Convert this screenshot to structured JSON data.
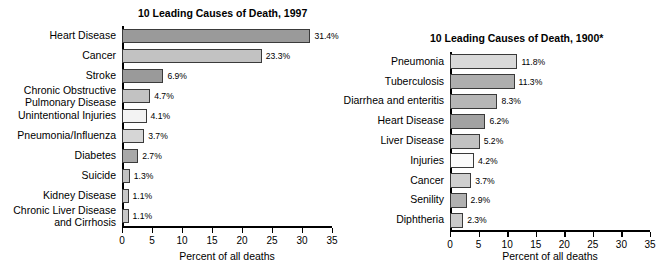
{
  "chart_data": [
    {
      "id": "left",
      "type": "bar",
      "orientation": "horizontal",
      "title": "10 Leading Causes of Death, 1997",
      "xlabel": "Percent of all deaths",
      "ylabel": "",
      "xlim": [
        0,
        35
      ],
      "xticks": [
        0,
        5,
        10,
        15,
        20,
        25,
        30,
        35
      ],
      "xticklabels": [
        "0",
        "5",
        "10",
        "15",
        "20",
        "25",
        "30",
        "35"
      ],
      "grid": false,
      "legend": false,
      "categories": [
        "Heart Disease",
        "Cancer",
        "Chronic Obstructive\nPulmonary Disease",
        "Stroke",
        "Unintentional Injuries",
        "Pneumonia/Influenza",
        "Diabetes",
        "Suicide",
        "Kidney Disease",
        "Chronic Liver Disease\nand Cirrhosis"
      ],
      "bars": [
        {
          "label": "Heart Disease",
          "value": 31.4,
          "value_label": "31.4%",
          "color": "#9a9a9a"
        },
        {
          "label": "Cancer",
          "value": 23.3,
          "value_label": "23.3%",
          "color": "#c2c2c2"
        },
        {
          "label": "Stroke",
          "value": 6.9,
          "value_label": "6.9%",
          "color": "#9a9a9a"
        },
        {
          "label": "Chronic Obstructive\nPulmonary Disease",
          "value": 4.7,
          "value_label": "4.7%",
          "color": "#c2c2c2"
        },
        {
          "label": "Unintentional Injuries",
          "value": 4.1,
          "value_label": "4.1%",
          "color": "#f3f3f3"
        },
        {
          "label": "Pneumonia/Influenza",
          "value": 3.7,
          "value_label": "3.7%",
          "color": "#d6d6d6"
        },
        {
          "label": "Diabetes",
          "value": 2.7,
          "value_label": "2.7%",
          "color": "#a8a8a8"
        },
        {
          "label": "Suicide",
          "value": 1.3,
          "value_label": "1.3%",
          "color": "#c2c2c2"
        },
        {
          "label": "Kidney Disease",
          "value": 1.1,
          "value_label": "1.1%",
          "color": "#c8c8c8"
        },
        {
          "label": "Chronic Liver Disease\nand Cirrhosis",
          "value": 1.1,
          "value_label": "1.1%",
          "color": "#c8c8c8"
        }
      ]
    },
    {
      "id": "right",
      "type": "bar",
      "orientation": "horizontal",
      "title": "10 Leading Causes of Death, 1900*",
      "xlabel": "Percent of all deaths",
      "ylabel": "",
      "xlim": [
        0,
        35
      ],
      "xticks": [
        0,
        5,
        10,
        15,
        20,
        25,
        30,
        35
      ],
      "xticklabels": [
        "0",
        "5",
        "10",
        "15",
        "20",
        "25",
        "30",
        "35"
      ],
      "grid": false,
      "legend": false,
      "categories": [
        "Pneumonia",
        "Tuberculosis",
        "Diarrhea and enteritis",
        "Heart Disease",
        "Liver Disease",
        "Injuries",
        "Cancer",
        "Senility",
        "Diphtheria"
      ],
      "bars": [
        {
          "label": "Pneumonia",
          "value": 11.8,
          "value_label": "11.8%",
          "color": "#d9d9d9"
        },
        {
          "label": "Tuberculosis",
          "value": 11.3,
          "value_label": "11.3%",
          "color": "#aeaeae"
        },
        {
          "label": "Diarrhea and enteritis",
          "value": 8.3,
          "value_label": "8.3%",
          "color": "#b6b6b6"
        },
        {
          "label": "Heart Disease",
          "value": 6.2,
          "value_label": "6.2%",
          "color": "#a2a2a2"
        },
        {
          "label": "Liver Disease",
          "value": 5.2,
          "value_label": "5.2%",
          "color": "#c2c2c2"
        },
        {
          "label": "Injuries",
          "value": 4.2,
          "value_label": "4.2%",
          "color": "#fbfbfb"
        },
        {
          "label": "Cancer",
          "value": 3.7,
          "value_label": "3.7%",
          "color": "#cfcfcf"
        },
        {
          "label": "Senility",
          "value": 2.9,
          "value_label": "2.9%",
          "color": "#b0b0b0"
        },
        {
          "label": "Diphtheria",
          "value": 2.3,
          "value_label": "2.3%",
          "color": "#cacaca"
        }
      ]
    }
  ]
}
